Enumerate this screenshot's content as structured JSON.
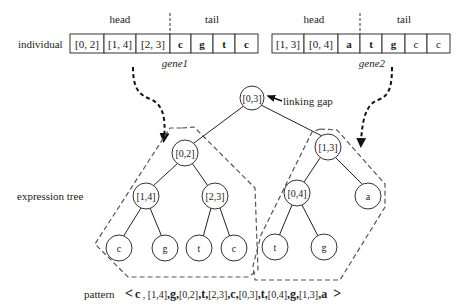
{
  "labels": {
    "individual": "individual",
    "expression_tree": "expression tree",
    "pattern_label": "pattern",
    "linking_gap": "linking gap"
  },
  "gene1": {
    "name": "gene1",
    "head_label": "head",
    "tail_label": "tail",
    "cells": [
      "[0, 2]",
      "[1, 4]",
      "[2, 3]",
      "c",
      "g",
      "t",
      "c"
    ]
  },
  "gene2": {
    "name": "gene2",
    "head_label": "head",
    "tail_label": "tail",
    "cells": [
      "[1, 3]",
      "[0, 4]",
      "a",
      "t",
      "g",
      "c",
      "c"
    ]
  },
  "tree": {
    "root": "[0,3]",
    "left": {
      "root": "[0,2]",
      "l": "[1,4]",
      "r": "[2,3]",
      "ll": "c",
      "lr": "g",
      "rl": "t",
      "rr": "c"
    },
    "right": {
      "root": "[1,3]",
      "l": "[0,4]",
      "r": "a",
      "ll": "t",
      "lr": "g"
    }
  },
  "pattern": {
    "open": "<",
    "close": ">",
    "tokens": [
      "c",
      "[1,4]",
      "g",
      "[0,2]",
      "t",
      "[2,3]",
      "c",
      "[0,3]",
      "t",
      "[0,4]",
      "g",
      "[1,3]",
      "a"
    ]
  }
}
